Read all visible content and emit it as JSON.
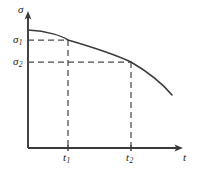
{
  "figure": {
    "background_color": "#ffffff",
    "line_color": "#3a3a3a",
    "dash_color": "#4a4a4a",
    "text_color": "#1d1d1d",
    "width": 198,
    "height": 173
  },
  "axes": {
    "y": {
      "label": "σ",
      "label_name": "sigma",
      "origin_px": [
        28,
        148
      ],
      "arrow_tip_px": [
        28,
        14
      ]
    },
    "x": {
      "label": "t",
      "label_name": "time",
      "origin_px": [
        28,
        148
      ],
      "arrow_tip_px": [
        180,
        148
      ]
    }
  },
  "y_ticks": [
    {
      "label": "σ",
      "sub": "1",
      "value_px_y": 40
    },
    {
      "label": "σ",
      "sub": "2",
      "value_px_y": 62
    }
  ],
  "x_ticks": [
    {
      "label": "t",
      "sub": "1",
      "value_px_x": 68
    },
    {
      "label": "t",
      "sub": "2",
      "value_px_x": 131
    }
  ],
  "guides": [
    {
      "name": "sigma-1-horizontal",
      "from_px": [
        28,
        40
      ],
      "to_px": [
        68,
        40
      ]
    },
    {
      "name": "t-1-vertical",
      "from_px": [
        68,
        40
      ],
      "to_px": [
        68,
        148
      ]
    },
    {
      "name": "sigma-2-horizontal",
      "from_px": [
        28,
        62
      ],
      "to_px": [
        131,
        62
      ]
    },
    {
      "name": "t-2-vertical",
      "from_px": [
        131,
        62
      ],
      "to_px": [
        131,
        148
      ]
    }
  ],
  "chart_data": {
    "type": "line",
    "title": "",
    "xlabel": "t",
    "ylabel": "σ",
    "grid": false,
    "legend": null,
    "annotations": [
      "σ₁ is the stress at time t₁",
      "σ₂ is the stress at time t₂",
      "σ₁ > σ₂ and t₁ < t₂"
    ],
    "axis_ranges": {
      "x": [
        0,
        1
      ],
      "y": [
        0,
        1
      ]
    },
    "series": [
      {
        "name": "stress-relaxation",
        "description": "Monotonically decreasing concave-down curve of stress against time",
        "points_px": [
          [
            28,
            30
          ],
          [
            45,
            32
          ],
          [
            62,
            36
          ],
          [
            68,
            40
          ],
          [
            85,
            44
          ],
          [
            102,
            50
          ],
          [
            118,
            56
          ],
          [
            131,
            62
          ],
          [
            145,
            71
          ],
          [
            158,
            82
          ],
          [
            172,
            95
          ]
        ],
        "path_d": "M 28 30 C 48 31, 62 36, 68 40 C 92 47, 116 55, 131 62 C 148 72, 162 83, 172 95"
      }
    ],
    "marked_points": [
      {
        "name": "point-1",
        "x_label": "t₁",
        "y_label": "σ₁",
        "px": [
          68,
          40
        ]
      },
      {
        "name": "point-2",
        "x_label": "t₂",
        "y_label": "σ₂",
        "px": [
          131,
          62
        ]
      }
    ]
  }
}
